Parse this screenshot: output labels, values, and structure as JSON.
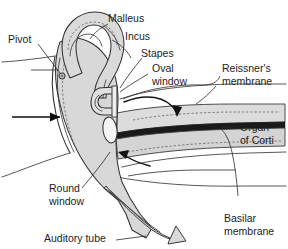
{
  "figure": {
    "background_color": "#ffffff",
    "tissue_fill": "#d8d8d8",
    "tissue_fill_light": "#e4e4e4",
    "outline_color": "#333333",
    "text_color": "#1d1d1d",
    "membrane_dark_color": "#1a1a1a"
  },
  "labels": {
    "pivot": "Pivot",
    "malleus": "Malleus",
    "incus": "Incus",
    "stapes": "Stapes",
    "oval_window_line1": "Oval",
    "oval_window_line2": "window",
    "reissners_line1": "Reissner's",
    "reissners_line2": "membrane",
    "organ_line1": "Organ",
    "organ_line2": "of Corti",
    "basilar_line1": "Basilar",
    "basilar_line2": "membrane",
    "round_window_line1": "Round",
    "round_window_line2": "window",
    "auditory_tube": "Auditory tube"
  },
  "annotations": {
    "sound_input_arrow": "sound-wave-direction-arrow",
    "fluid_wave_arrow_upper": "perilymph-flow-arrow-forward",
    "fluid_wave_arrow_lower": "perilymph-flow-arrow-return"
  }
}
